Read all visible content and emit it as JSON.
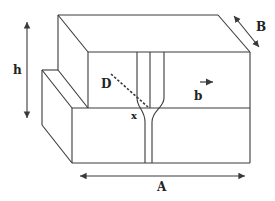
{
  "diagram": {
    "labels": {
      "h": "h",
      "B": "B",
      "A": "A",
      "D": "D",
      "b": "b",
      "x": "x"
    },
    "colors": {
      "stroke": "#3a3a3a",
      "background": "#ffffff"
    }
  }
}
